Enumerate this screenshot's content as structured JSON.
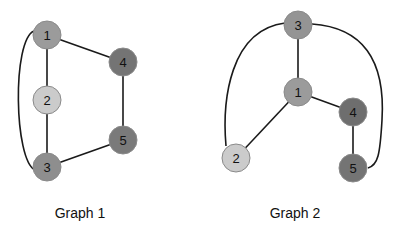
{
  "colors": {
    "light": "#cbcbcb",
    "medium": "#9b9b9b",
    "dark": "#747474",
    "edge": "#1a1a1a"
  },
  "graphs": [
    {
      "label": "Graph 1",
      "label_pos": [
        80,
        213
      ],
      "nodes": [
        {
          "id": "1",
          "x": 47,
          "y": 35,
          "shade": "medium"
        },
        {
          "id": "2",
          "x": 47,
          "y": 100,
          "shade": "light"
        },
        {
          "id": "3",
          "x": 47,
          "y": 167,
          "shade": "medium"
        },
        {
          "id": "4",
          "x": 123,
          "y": 62,
          "shade": "dark"
        },
        {
          "id": "5",
          "x": 123,
          "y": 140,
          "shade": "dark"
        }
      ],
      "edges": [
        {
          "from": "1",
          "to": "2"
        },
        {
          "from": "2",
          "to": "3"
        },
        {
          "from": "1",
          "to": "4"
        },
        {
          "from": "4",
          "to": "5"
        },
        {
          "from": "5",
          "to": "3"
        },
        {
          "from": "1",
          "to": "3",
          "curved": true
        }
      ]
    },
    {
      "label": "Graph 2",
      "label_pos": [
        295,
        213
      ],
      "nodes": [
        {
          "id": "3",
          "x": 298,
          "y": 25,
          "shade": "medium"
        },
        {
          "id": "1",
          "x": 298,
          "y": 92,
          "shade": "medium"
        },
        {
          "id": "4",
          "x": 353,
          "y": 112,
          "shade": "dark"
        },
        {
          "id": "2",
          "x": 236,
          "y": 158,
          "shade": "light"
        },
        {
          "id": "5",
          "x": 353,
          "y": 168,
          "shade": "dark"
        }
      ],
      "edges": [
        {
          "from": "3",
          "to": "1"
        },
        {
          "from": "1",
          "to": "4"
        },
        {
          "from": "4",
          "to": "5"
        },
        {
          "from": "1",
          "to": "2"
        },
        {
          "from": "3",
          "to": "2",
          "curved": true
        },
        {
          "from": "3",
          "to": "5",
          "curved": true
        }
      ]
    }
  ]
}
